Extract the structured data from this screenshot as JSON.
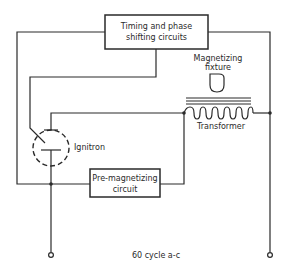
{
  "diagram": {
    "type": "circuit-schematic",
    "colors": {
      "ink": "#2a2a2a",
      "background": "#ffffff"
    },
    "blocks": {
      "timing": {
        "line1": "Timing and phase",
        "line2": "shifting circuits"
      },
      "premag": {
        "line1": "Pre-magnetizing",
        "line2": "circuit"
      }
    },
    "components": {
      "fixture": {
        "line1": "Magnetizing",
        "line2": "fixture"
      },
      "transformer": {
        "label": "Transformer"
      },
      "ignitron": {
        "label": "Ignitron"
      }
    },
    "supply": {
      "label": "60 cycle a-c"
    }
  }
}
